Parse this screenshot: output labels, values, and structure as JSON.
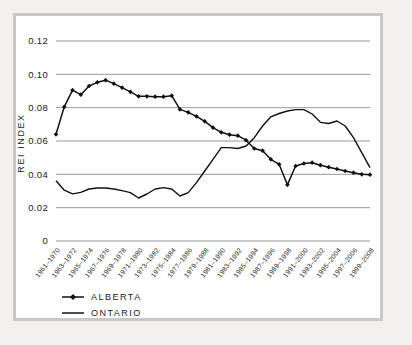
{
  "figure": {
    "background_color": "#f2f1ef",
    "panel_color": "#ffffff",
    "frame_color": "#c9c8c6"
  },
  "chart_data": {
    "type": "line",
    "title": "",
    "xlabel": "",
    "ylabel": "REI INDEX",
    "ylim": [
      0,
      0.12
    ],
    "yticks": [
      0,
      0.02,
      0.04,
      0.06,
      0.08,
      0.1,
      0.12
    ],
    "ytick_labels": [
      "0",
      "0.02",
      "0.04",
      "0.06",
      "0.08",
      "0.10",
      "0.12"
    ],
    "grid": true,
    "grid_axis": "y",
    "legend_position": "below-left",
    "categories": [
      "1961–1970",
      "1962–1971",
      "1963–1972",
      "1964–1973",
      "1965–1974",
      "1966–1975",
      "1967–1976",
      "1968–1977",
      "1969–1978",
      "1970–1979",
      "1971–1980",
      "1972–1981",
      "1973–1982",
      "1974–1983",
      "1975–1984",
      "1976–1985",
      "1977–1986",
      "1978–1987",
      "1979–1988",
      "1980–1989",
      "1981–1990",
      "1982–1991",
      "1983–1992",
      "1984–1993",
      "1985–1994",
      "1986–1995",
      "1987–1996",
      "1988–1997",
      "1989–1998",
      "1990–1999",
      "1991–2000",
      "1992–2001",
      "1993–2002",
      "1994–2003",
      "1995–2004",
      "1996–2005",
      "1997–2006",
      "1998–2007",
      "1999–2008"
    ],
    "xtick_labels": [
      "1961–1970",
      "1963–1972",
      "1965–1974",
      "1967–1976",
      "1969–1978",
      "1971–1980",
      "1973–1982",
      "1975–1984",
      "1977–1986",
      "1979–1988",
      "1981–1990",
      "1983–1992",
      "1985–1994",
      "1987–1996",
      "1989–1998",
      "1991–2000",
      "1993–2002",
      "1995–2004",
      "1997–2006",
      "1999–2008"
    ],
    "series": [
      {
        "name": "ALBERTA",
        "color": "#111111",
        "marker": "diamond",
        "values": [
          0.064,
          0.0805,
          0.0905,
          0.0878,
          0.093,
          0.0952,
          0.0965,
          0.0944,
          0.092,
          0.0895,
          0.0868,
          0.0868,
          0.0866,
          0.0866,
          0.0872,
          0.079,
          0.0772,
          0.0748,
          0.0718,
          0.068,
          0.0652,
          0.0638,
          0.0632,
          0.0605,
          0.0555,
          0.0542,
          0.049,
          0.046,
          0.0337,
          0.045,
          0.0465,
          0.047,
          0.0455,
          0.0443,
          0.0432,
          0.042,
          0.041,
          0.04,
          0.0398
        ]
      },
      {
        "name": "ONTARIO",
        "color": "#111111",
        "marker": "none",
        "values": [
          0.0362,
          0.0305,
          0.0283,
          0.0292,
          0.0312,
          0.0318,
          0.0318,
          0.0312,
          0.0302,
          0.029,
          0.0258,
          0.0282,
          0.0312,
          0.032,
          0.0312,
          0.027,
          0.029,
          0.035,
          0.042,
          0.049,
          0.056,
          0.056,
          0.0555,
          0.057,
          0.062,
          0.069,
          0.0745,
          0.0765,
          0.078,
          0.0788,
          0.0788,
          0.0762,
          0.0712,
          0.0705,
          0.072,
          0.069,
          0.062,
          0.053,
          0.044
        ]
      }
    ],
    "series_tail_note": {
      "alberta_tail": [
        0.0345,
        0.0215,
        0.0165,
        0.016,
        0.016,
        0.0165,
        0.0178,
        0.019,
        0.0197,
        0.0202
      ],
      "ontario_tail": [
        0.04,
        0.034,
        0.03,
        0.0272,
        0.0258
      ]
    }
  },
  "legend": {
    "items": [
      {
        "label": "ALBERTA",
        "marker": "diamond"
      },
      {
        "label": "ONTARIO",
        "marker": "line"
      }
    ]
  }
}
